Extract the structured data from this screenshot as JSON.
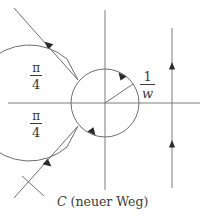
{
  "figure": {
    "kind": "complex-contour-diagram",
    "background_color": "#ffffff",
    "stroke_color": "#6e6e6e",
    "text_color": "#3a3a3a",
    "width": 208,
    "height": 222,
    "caption": {
      "curve_symbol": "C",
      "description": "(neuer Weg)"
    },
    "labels": {
      "angle_upper": {
        "numerator": "π",
        "denominator": "4"
      },
      "angle_lower": {
        "numerator": "π",
        "denominator": "4"
      },
      "radius": {
        "numerator": "1",
        "denominator": "w"
      }
    },
    "axes": {
      "origin_x": 105,
      "origin_y": 103,
      "real_axis": {
        "x1": 8,
        "y1": 103,
        "x2": 200,
        "y2": 103
      },
      "imaginary_axis": {
        "x1": 105,
        "y1": 10,
        "x2": 105,
        "y2": 190
      }
    },
    "circle": {
      "center_x": 105,
      "center_y": 103,
      "radius": 34,
      "orientation": "clockwise",
      "radius_line": {
        "x1": 105,
        "y1": 103,
        "x2": 133,
        "y2": 84
      }
    },
    "branch_line": {
      "x": 172,
      "y_top": 28,
      "y_bottom": 188,
      "arrow_direction": "up",
      "arrow_count": 2
    },
    "rays": {
      "upper": {
        "x1": 14,
        "y1": 8,
        "x2": 78,
        "y2": 80,
        "arrow_direction": "toward-upper-left"
      },
      "lower": {
        "x1": 14,
        "y1": 198,
        "x2": 78,
        "y2": 126,
        "arrow_direction": "toward-lower-left"
      },
      "tick": {
        "x1": 22,
        "y1": 176,
        "x2": 44,
        "y2": 196
      }
    },
    "left_arc": {
      "center_x": 105,
      "center_y": 103,
      "radius": 58,
      "start_angle_deg": 131,
      "end_angle_deg": 229
    }
  }
}
